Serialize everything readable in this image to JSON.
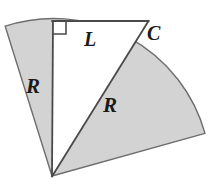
{
  "figure": {
    "background_color": "#ffffff",
    "sector_fill_color": "#d3d3d3",
    "triangle_fill_color": "#ffffff",
    "stroke_color": "#555555",
    "label_color": "#1a1a1a",
    "labels": {
      "radius_left": "R",
      "chord_top": "L",
      "point_c": "C",
      "radius_hypotenuse": "R"
    },
    "geometry": {
      "sector_apex": [
        52,
        176
      ],
      "sector_radius": 157,
      "arc_start": [
        5,
        26
      ],
      "arc_end": [
        205,
        133
      ],
      "right_angle_vertex": [
        53,
        21
      ],
      "right_angle_marker_size": 13,
      "top_right_vertex": [
        148,
        21
      ],
      "vertical_leg": [
        [
          53,
          21
        ],
        [
          52,
          176
        ]
      ],
      "horizontal_leg": [
        [
          53,
          21
        ],
        [
          148,
          21
        ]
      ],
      "hypotenuse": [
        [
          148,
          21
        ],
        [
          52,
          176
        ]
      ]
    }
  }
}
